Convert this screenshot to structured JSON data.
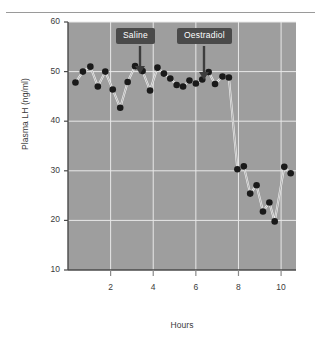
{
  "chart_data": {
    "type": "line",
    "title": "",
    "xlabel": "Hours",
    "ylabel": "Plasma LH (ng/ml)",
    "xlim": [
      0,
      10.7
    ],
    "ylim": [
      10,
      60
    ],
    "xticks": [
      2,
      4,
      6,
      8,
      10
    ],
    "yticks": [
      10,
      20,
      30,
      40,
      50,
      60
    ],
    "grid": true,
    "legend": null,
    "plot_bgcolor": "#9e9e9e",
    "gridline_color": "#e8e8e8",
    "line_color": "#f2f2f2",
    "marker_color": "#1a1a1a",
    "series": [
      {
        "name": "Plasma LH",
        "x": [
          0.35,
          0.7,
          1.05,
          1.4,
          1.75,
          2.1,
          2.45,
          2.8,
          3.15,
          3.5,
          3.85,
          4.2,
          4.5,
          4.8,
          5.1,
          5.4,
          5.7,
          6.0,
          6.3,
          6.6,
          6.9,
          7.25,
          7.55,
          7.95,
          8.25,
          8.55,
          8.85,
          9.15,
          9.45,
          9.7,
          10.15,
          10.45
        ],
        "y": [
          47.8,
          50.0,
          51.0,
          47.0,
          50.0,
          46.4,
          42.7,
          47.9,
          51.1,
          50.1,
          46.2,
          50.8,
          49.6,
          48.6,
          47.3,
          47.0,
          48.2,
          47.6,
          48.4,
          49.9,
          47.5,
          49.0,
          48.8,
          30.3,
          30.9,
          25.4,
          27.1,
          21.8,
          23.6,
          19.8,
          30.8,
          29.5
        ]
      }
    ],
    "annotations": [
      {
        "label": "Saline",
        "x": 3.15,
        "y_arrow_top": 50.5,
        "box_x_px": 116,
        "box_y_px": 28,
        "arrow_x_px": 140,
        "arrow_top_px": 46,
        "arrow_bottom_px": 74
      },
      {
        "label": "Oestradiol",
        "x": 6.3,
        "y_arrow_top": 48.6,
        "box_x_px": 177,
        "box_y_px": 28,
        "arrow_x_px": 204,
        "arrow_top_px": 46,
        "arrow_bottom_px": 80
      }
    ]
  }
}
